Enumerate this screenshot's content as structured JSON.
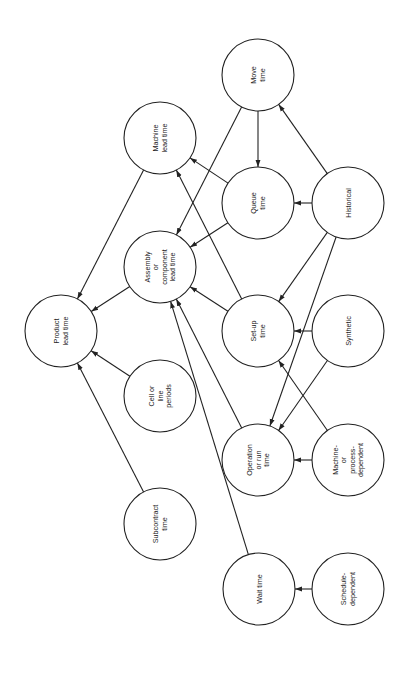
{
  "diagram": {
    "type": "directed-graph",
    "orientation": "rotated-90-ccw",
    "colors": {
      "stroke": "#222222",
      "background": "#ffffff",
      "node_fill": "#ffffff"
    },
    "node_radius": 36,
    "nodes": [
      {
        "id": "product",
        "lines": [
          "Product",
          "lead time"
        ],
        "x": 61,
        "y": 331
      },
      {
        "id": "machine_lead",
        "lines": [
          "Machine",
          "lead time"
        ],
        "x": 160,
        "y": 138
      },
      {
        "id": "assembly",
        "lines": [
          "Assembly",
          "or",
          "component",
          "lead time"
        ],
        "x": 160,
        "y": 267
      },
      {
        "id": "cell",
        "lines": [
          "Cell or",
          "line",
          "periods"
        ],
        "x": 160,
        "y": 396
      },
      {
        "id": "subcontract",
        "lines": [
          "Subcontract",
          "time"
        ],
        "x": 160,
        "y": 524
      },
      {
        "id": "move",
        "lines": [
          "Move",
          "time"
        ],
        "x": 258,
        "y": 75
      },
      {
        "id": "queue",
        "lines": [
          "Queue",
          "time"
        ],
        "x": 258,
        "y": 203
      },
      {
        "id": "setup",
        "lines": [
          "Set-up",
          "time"
        ],
        "x": 258,
        "y": 331
      },
      {
        "id": "operation",
        "lines": [
          "Operation",
          "or run",
          "time"
        ],
        "x": 258,
        "y": 460
      },
      {
        "id": "wait",
        "lines": [
          "Wait time"
        ],
        "x": 259,
        "y": 589
      },
      {
        "id": "historical",
        "lines": [
          "Historical"
        ],
        "x": 348,
        "y": 203
      },
      {
        "id": "synthetic",
        "lines": [
          "Synthetic"
        ],
        "x": 348,
        "y": 331
      },
      {
        "id": "machine_dep",
        "lines": [
          "Machine-",
          "or",
          "process-",
          "dependent"
        ],
        "x": 348,
        "y": 460
      },
      {
        "id": "schedule_dep",
        "lines": [
          "Schedule-",
          "dependent"
        ],
        "x": 348,
        "y": 589
      }
    ],
    "edges": [
      {
        "from": "machine_lead",
        "to": "product"
      },
      {
        "from": "assembly",
        "to": "product"
      },
      {
        "from": "cell",
        "to": "product"
      },
      {
        "from": "subcontract",
        "to": "product"
      },
      {
        "from": "move",
        "to": "queue"
      },
      {
        "from": "move",
        "to": "assembly"
      },
      {
        "from": "queue",
        "to": "machine_lead"
      },
      {
        "from": "queue",
        "to": "assembly"
      },
      {
        "from": "setup",
        "to": "machine_lead"
      },
      {
        "from": "setup",
        "to": "assembly"
      },
      {
        "from": "operation",
        "to": "assembly"
      },
      {
        "from": "wait",
        "to": "assembly"
      },
      {
        "from": "historical",
        "to": "move"
      },
      {
        "from": "historical",
        "to": "queue"
      },
      {
        "from": "historical",
        "to": "setup"
      },
      {
        "from": "historical",
        "to": "operation"
      },
      {
        "from": "synthetic",
        "to": "setup"
      },
      {
        "from": "synthetic",
        "to": "operation"
      },
      {
        "from": "machine_dep",
        "to": "setup"
      },
      {
        "from": "machine_dep",
        "to": "operation"
      },
      {
        "from": "schedule_dep",
        "to": "wait"
      }
    ]
  }
}
